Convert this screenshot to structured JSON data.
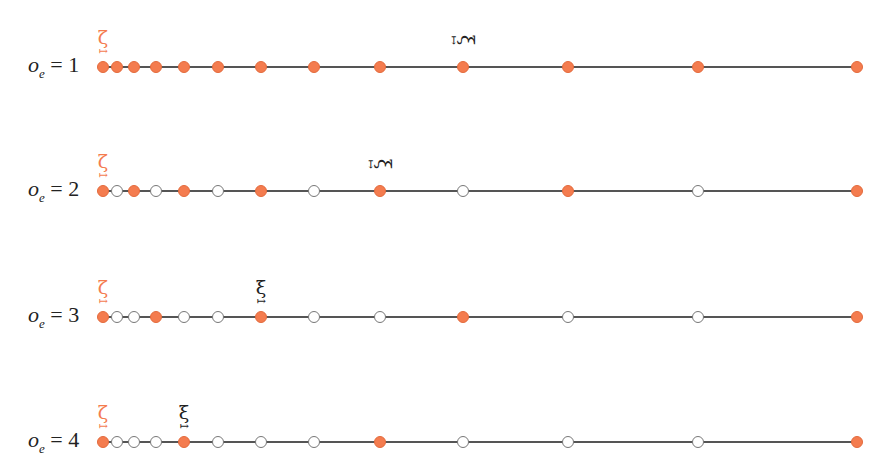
{
  "diagram": {
    "line_x_start": 103,
    "line_x_end": 857,
    "node_positions_x": [
      103,
      117,
      134,
      156,
      184,
      218,
      261,
      314,
      380,
      463,
      568,
      698,
      857
    ],
    "colors": {
      "filled_node": "#f47c4f",
      "hollow_node_stroke": "#777777",
      "line": "#555555",
      "zeta_label": "#f47c4f",
      "xi_label": "#222222"
    },
    "zeta_symbol": "ζ",
    "xi_symbol": "ξ",
    "arrow_symbol": "↦",
    "rows": [
      {
        "label_var": "o",
        "label_sub": "e",
        "label_eq": " = 1",
        "y": 67,
        "filled": [
          1,
          1,
          1,
          1,
          1,
          1,
          1,
          1,
          1,
          1,
          1,
          1,
          1
        ],
        "xi_index": 9,
        "xi_rotated": true
      },
      {
        "label_var": "o",
        "label_sub": "e",
        "label_eq": " = 2",
        "y": 191,
        "filled": [
          1,
          0,
          1,
          0,
          1,
          0,
          1,
          0,
          1,
          0,
          1,
          0,
          1
        ],
        "xi_index": 8,
        "xi_rotated": true
      },
      {
        "label_var": "o",
        "label_sub": "e",
        "label_eq": " = 3",
        "y": 317,
        "filled": [
          1,
          0,
          0,
          1,
          0,
          0,
          1,
          0,
          0,
          1,
          0,
          0,
          1
        ],
        "xi_index": 6,
        "xi_rotated": false
      },
      {
        "label_var": "o",
        "label_sub": "e",
        "label_eq": " = 4",
        "y": 442,
        "filled": [
          1,
          0,
          0,
          0,
          1,
          0,
          0,
          0,
          1,
          0,
          0,
          0,
          1
        ],
        "xi_index": 4,
        "xi_rotated": false
      }
    ]
  }
}
